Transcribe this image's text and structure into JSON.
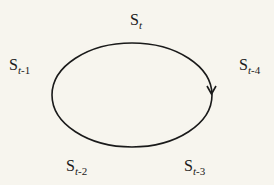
{
  "diagram": {
    "type": "cycle",
    "direction": "clockwise",
    "background_color": "#f7f5ee",
    "stroke_color": "#1a1a1a",
    "ellipse": {
      "cx": 132,
      "cy": 95,
      "rx": 80,
      "ry": 52
    },
    "arrow": {
      "position": "right side",
      "points": "down"
    },
    "nodes": [
      {
        "id": "t",
        "base": "S",
        "sub_var": "t",
        "sub_rest": "",
        "position": "top"
      },
      {
        "id": "t1",
        "base": "S",
        "sub_var": "t",
        "sub_rest": "-1",
        "position": "left"
      },
      {
        "id": "t4",
        "base": "S",
        "sub_var": "t",
        "sub_rest": "-4",
        "position": "right"
      },
      {
        "id": "t2",
        "base": "S",
        "sub_var": "t",
        "sub_rest": "-2",
        "position": "bottom-left"
      },
      {
        "id": "t3",
        "base": "S",
        "sub_var": "t",
        "sub_rest": "-3",
        "position": "bottom-right"
      }
    ]
  }
}
